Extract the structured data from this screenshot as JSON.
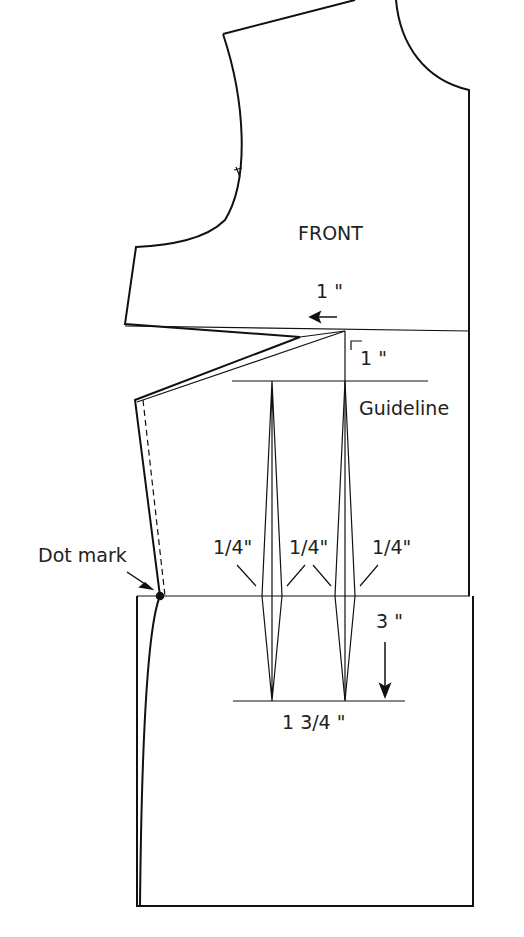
{
  "diagram": {
    "title": "FRONT",
    "labels": {
      "shift": "1 \"",
      "guide_offset": "1 \"",
      "guideline": "Guideline",
      "dot_mark": "Dot mark",
      "dart_width_1": "1/4\"",
      "dart_width_2": "1/4\"",
      "dart_width_3": "1/4\"",
      "dart_length": "3 \"",
      "dart_spacing": "1 3/4 \""
    },
    "colors": {
      "line": "#111111",
      "background": "#ffffff"
    }
  }
}
